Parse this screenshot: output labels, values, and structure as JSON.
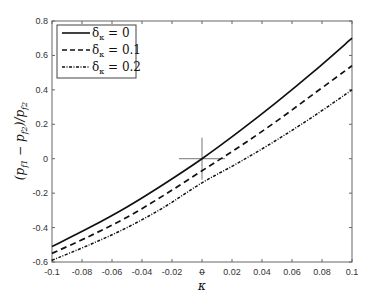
{
  "chart_data": {
    "type": "line",
    "title": "",
    "xlabel": "κ̄",
    "ylabel": "(p_f1 − p_f2)/p_f2",
    "xlim": [
      -0.1,
      0.1
    ],
    "ylim": [
      -0.6,
      0.8
    ],
    "xticks": [
      -0.1,
      -0.08,
      -0.06,
      -0.04,
      -0.02,
      0,
      0.02,
      0.04,
      0.06,
      0.08,
      0.1
    ],
    "xtick_labels": [
      "-0.1",
      "-0.08",
      "-0.06",
      "-0.04",
      "-0.02",
      "0",
      "0.02",
      "0.04",
      "0.06",
      "0.08",
      "0.1"
    ],
    "yticks": [
      -0.6,
      -0.4,
      -0.2,
      0,
      0.2,
      0.4,
      0.6,
      0.8
    ],
    "ytick_labels": [
      "-0.6",
      "-0.4",
      "-0.2",
      "0",
      "0.2",
      "0.4",
      "0.6",
      "0.8"
    ],
    "grid": false,
    "legend_position": "upper left",
    "x": [
      -0.1,
      -0.075,
      -0.05,
      -0.025,
      0,
      0.025,
      0.05,
      0.075,
      0.1
    ],
    "series": [
      {
        "name": "δ_κ = 0",
        "style": "solid",
        "values": [
          -0.51,
          -0.4,
          -0.28,
          -0.145,
          0.0,
          0.16,
          0.33,
          0.51,
          0.7
        ]
      },
      {
        "name": "δ_κ = 0.1",
        "style": "dashed",
        "values": [
          -0.55,
          -0.45,
          -0.34,
          -0.21,
          -0.07,
          0.07,
          0.22,
          0.38,
          0.54
        ]
      },
      {
        "name": "δ_κ = 0.2",
        "style": "dashdot",
        "values": [
          -0.59,
          -0.5,
          -0.4,
          -0.28,
          -0.14,
          -0.02,
          0.11,
          0.25,
          0.4
        ]
      }
    ],
    "annotations": [
      {
        "type": "crosshair",
        "x": 0,
        "y": 0
      }
    ]
  },
  "legend": {
    "items": [
      {
        "label": "δ",
        "sub": "κ",
        "rest": " = 0"
      },
      {
        "label": "δ",
        "sub": "κ",
        "rest": " = 0.1"
      },
      {
        "label": "δ",
        "sub": "κ",
        "rest": " = 0.2"
      }
    ]
  },
  "axes": {
    "xlabel_main": "κ",
    "xlabel_bar": "‾",
    "ylabel_text": "(p",
    "ylabel_parts": [
      "(p",
      "f1",
      " − p",
      "f2",
      ")/p",
      "f2"
    ]
  },
  "colors": {
    "line": "#111111",
    "axis": "#555555",
    "crosshair": "#777777"
  }
}
